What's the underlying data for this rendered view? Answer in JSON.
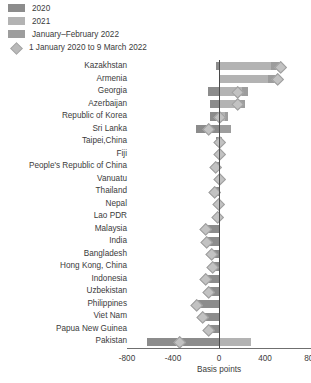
{
  "legend": {
    "items": [
      {
        "label": "2020",
        "icon": "square-swatch",
        "color": "#8c8c8c"
      },
      {
        "label": "2021",
        "icon": "square-swatch",
        "color": "#b3b3b3"
      },
      {
        "label": "January–February 2022",
        "icon": "square-swatch",
        "color": "#9d9d9d"
      },
      {
        "label": "1 January 2020 to 9 March 2022",
        "icon": "diamond-marker",
        "color": "#b9b9b9"
      }
    ]
  },
  "axis": {
    "xlabel": "Basis points",
    "ticks": [
      "-800",
      "-400",
      "0",
      "400",
      "800"
    ],
    "tick_values": [
      -800,
      -400,
      0,
      400,
      800
    ],
    "xlim": [
      -800,
      800
    ]
  },
  "chart_data": {
    "type": "bar",
    "orientation": "horizontal",
    "stacked": true,
    "title": "",
    "xlabel": "Basis points",
    "ylabel": "",
    "xlim": [
      -800,
      800
    ],
    "grid": false,
    "legend_position": "top-left",
    "categories": [
      "Kazakhstan",
      "Armenia",
      "Georgia",
      "Azerbaijan",
      "Republic of Korea",
      "Sri Lanka",
      "Taipei,China",
      "Fiji",
      "People's Republic of China",
      "Vanuatu",
      "Thailand",
      "Nepal",
      "Lao PDR",
      "Malaysia",
      "India",
      "Bangladesh",
      "Hong Kong, China",
      "Indonesia",
      "Uzbekistan",
      "Philippines",
      "Viet Nam",
      "Papua New Guinea",
      "Pakistan"
    ],
    "series": [
      {
        "name": "2020",
        "color": "#8c8c8c",
        "values": [
          -25,
          0,
          -100,
          -75,
          -75,
          -200,
          -25,
          0,
          -30,
          0,
          -50,
          0,
          0,
          -125,
          -115,
          -75,
          -64,
          -125,
          -100,
          -200,
          -150,
          -100,
          -625
        ]
      },
      {
        "name": "2021",
        "color": "#b3b3b3",
        "values": [
          450,
          425,
          200,
          175,
          50,
          0,
          0,
          0,
          -5,
          0,
          0,
          0,
          0,
          0,
          0,
          0,
          0,
          0,
          0,
          0,
          0,
          0,
          275
        ]
      },
      {
        "name": "January-February 2022",
        "color": "#9d9d9d",
        "values": [
          100,
          75,
          50,
          50,
          25,
          100,
          25,
          0,
          0,
          0,
          0,
          0,
          0,
          0,
          0,
          0,
          0,
          0,
          0,
          0,
          0,
          0,
          0
        ]
      }
    ],
    "markers": {
      "name": "1 January 2020 to 9 March 2022",
      "color": "#b9b9b9",
      "values": [
        525,
        500,
        150,
        150,
        0,
        -100,
        0,
        0,
        -35,
        -5,
        -50,
        -10,
        -20,
        -125,
        -115,
        -75,
        -64,
        -125,
        -100,
        -200,
        -150,
        -100,
        -350
      ]
    }
  }
}
